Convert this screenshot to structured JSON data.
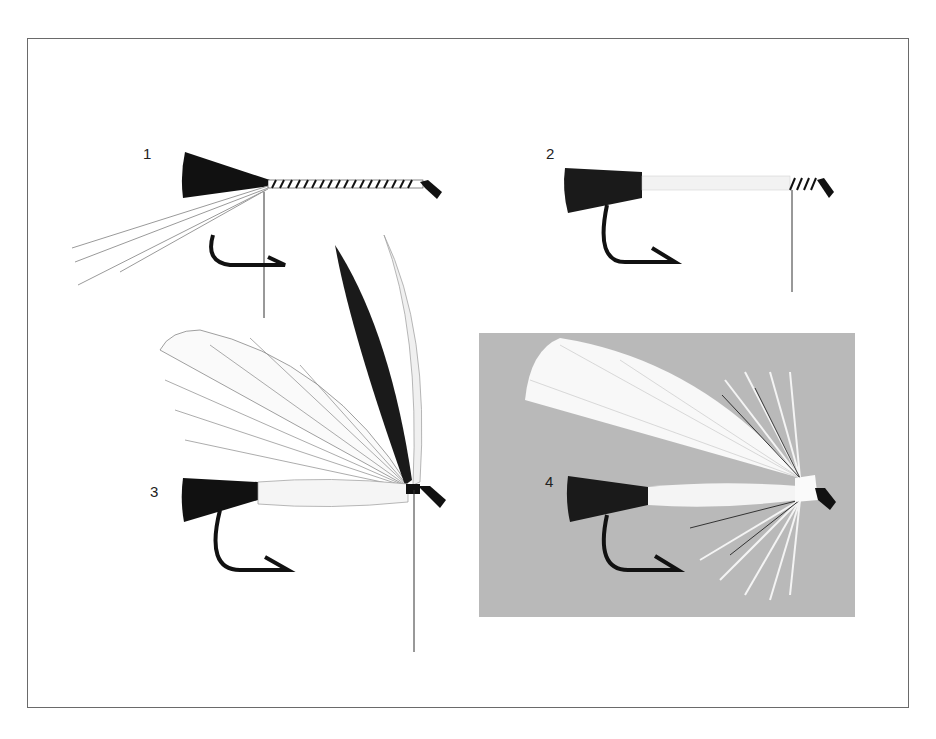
{
  "figure": {
    "stages": [
      {
        "number": "1",
        "description": "Black hackle tail tied in, ribbing tinsel and tying thread wound along shank"
      },
      {
        "number": "2",
        "description": "Body material wrapped over shank"
      },
      {
        "number": "3",
        "description": "Hackle feather wing tied in at head"
      },
      {
        "number": "4",
        "description": "Completed fly with white wing and throat hackle on grey background"
      }
    ]
  },
  "colors": {
    "background": "#ffffff",
    "frame": "#6a6a6a",
    "panel4_background": "#b9b9b9",
    "ink": "#111111",
    "feather_light": "#f4f4f4"
  }
}
